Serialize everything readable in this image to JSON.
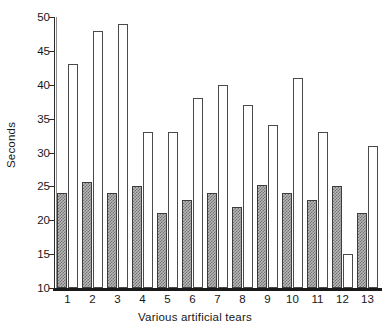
{
  "chart_data": {
    "type": "bar",
    "title": "",
    "subtitle": "",
    "xlabel": "Various artificial tears",
    "ylabel": "Seconds",
    "categories": [
      "1",
      "2",
      "3",
      "4",
      "5",
      "6",
      "7",
      "8",
      "9",
      "10",
      "11",
      "12",
      "13"
    ],
    "series": [
      {
        "name": "hatched-bar",
        "style": "hatched-gray",
        "values": [
          24,
          25.7,
          24,
          25,
          21,
          23,
          24,
          22,
          25.2,
          24,
          23,
          25,
          21
        ]
      },
      {
        "name": "open-bar",
        "style": "white-outline",
        "values": [
          43,
          48,
          49,
          33,
          33,
          38,
          40,
          37,
          34,
          41,
          33,
          15,
          31
        ]
      }
    ],
    "ylim": [
      10,
      50
    ],
    "yticks": [
      10,
      15,
      20,
      25,
      30,
      35,
      40,
      45,
      50
    ],
    "ytick_labels": [
      "10",
      "15",
      "20",
      "25",
      "30",
      "35",
      "40",
      "45",
      "50"
    ],
    "grid": false,
    "legend": "none",
    "colors": {
      "axis": "#1a1a1a",
      "open_bar_fill": "#ffffff",
      "open_bar_edge": "#4a4a4a",
      "hatch_bar_fill": "#b9b9b9",
      "hatch_bar_pattern": "#6f6f6f",
      "hatch_bar_edge": "#3c3c3c",
      "text": "#171717",
      "background": "#ffffff"
    }
  }
}
